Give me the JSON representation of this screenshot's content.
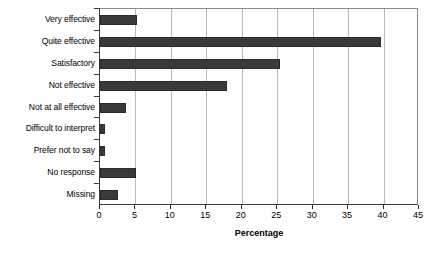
{
  "chart_data": {
    "type": "bar",
    "orientation": "horizontal",
    "title": "",
    "subtitle": "",
    "xlabel": "Percentage",
    "ylabel": "",
    "categories": [
      "Very effective",
      "Quite effective",
      "Satisfactory",
      "Not effective",
      "Not at all effective",
      "Difficult to interpret",
      "Prefer not to say",
      "No response",
      "Missing"
    ],
    "values": [
      5.2,
      39.7,
      25.4,
      17.9,
      3.6,
      0.7,
      0.7,
      5.1,
      2.5
    ],
    "xlim": [
      0,
      45
    ],
    "ylim": [
      0,
      9
    ],
    "xticks": [
      0,
      5,
      10,
      15,
      20,
      25,
      30,
      35,
      40,
      45
    ],
    "xtick_labels": [
      "0",
      "5",
      "10",
      "15",
      "20",
      "25",
      "30",
      "35",
      "40",
      "45"
    ],
    "grid": "vertical",
    "legend": "none",
    "bar_color": "#3a3a3a",
    "gridline_color": "#b9b9b9",
    "axis_color": "#2a2a2a",
    "background_color": "#ffffff"
  }
}
